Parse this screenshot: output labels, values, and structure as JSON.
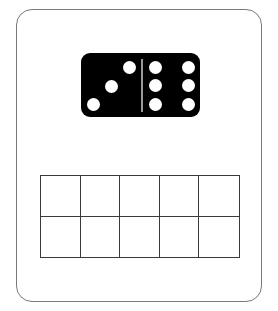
{
  "card": {
    "border_color": "#7a7a7a",
    "background": "#ffffff"
  },
  "domino": {
    "color": "#000000",
    "pip_color": "#ffffff",
    "left_half_pips": 3,
    "right_half_pips": 6,
    "left_pips": [
      [
        12,
        14
      ],
      [
        30,
        33
      ],
      [
        48,
        51
      ]
    ],
    "right_pips": [
      [
        74,
        14
      ],
      [
        74,
        32
      ],
      [
        74,
        51
      ],
      [
        107,
        14
      ],
      [
        107,
        32
      ],
      [
        107,
        51
      ]
    ]
  },
  "ten_frame": {
    "rows": 2,
    "columns": 5,
    "cells": [
      "",
      "",
      "",
      "",
      "",
      "",
      "",
      "",
      "",
      ""
    ],
    "line_color": "#3a3a3a"
  }
}
